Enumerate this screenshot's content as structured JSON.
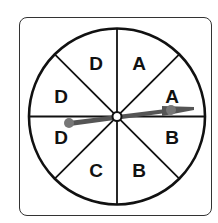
{
  "spinner": {
    "sections": [
      {
        "label": "A",
        "x": 139,
        "y": 63
      },
      {
        "label": "A",
        "x": 172,
        "y": 96
      },
      {
        "label": "B",
        "x": 172,
        "y": 137
      },
      {
        "label": "B",
        "x": 139,
        "y": 170
      },
      {
        "label": "C",
        "x": 96,
        "y": 170
      },
      {
        "label": "D",
        "x": 61,
        "y": 137
      },
      {
        "label": "D",
        "x": 61,
        "y": 96
      },
      {
        "label": "D",
        "x": 96,
        "y": 63
      }
    ],
    "pointer_direction": "A",
    "colors": {
      "outline": "#111111",
      "pointer": "#555555",
      "background": "#ffffff"
    }
  }
}
